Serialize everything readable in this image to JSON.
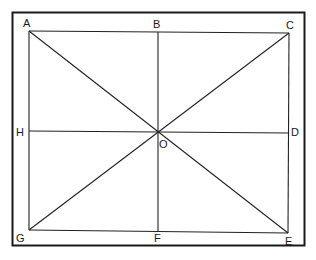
{
  "diagram": {
    "type": "geometric-figure",
    "colors": {
      "stroke": "#1a1a1a",
      "background": "#ffffff"
    },
    "points": {
      "A": {
        "label": "A",
        "position": "top-left corner"
      },
      "B": {
        "label": "B",
        "position": "top midpoint"
      },
      "C": {
        "label": "C",
        "position": "top-right corner"
      },
      "D": {
        "label": "D",
        "position": "right midpoint"
      },
      "E": {
        "label": "E",
        "position": "bottom-right corner"
      },
      "F": {
        "label": "F",
        "position": "bottom midpoint"
      },
      "G": {
        "label": "G",
        "position": "bottom-left corner"
      },
      "H": {
        "label": "H",
        "position": "left midpoint"
      },
      "O": {
        "label": "O",
        "position": "center intersection"
      }
    },
    "segments": [
      "AC",
      "CE",
      "EG",
      "GA",
      "AE",
      "CG",
      "BF",
      "HD"
    ]
  }
}
